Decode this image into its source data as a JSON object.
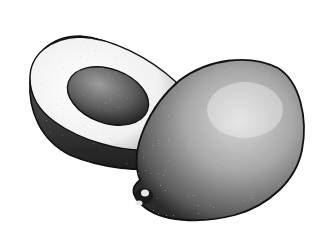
{
  "image": {
    "subject": "Stippled pen-and-ink illustration of avocados",
    "elements": [
      {
        "name": "halved-avocado",
        "description": "Avocado half showing flesh and seed, lying behind"
      },
      {
        "name": "whole-avocado",
        "description": "Whole pear-shaped avocado with stem end at lower left, in front"
      }
    ],
    "colors": {
      "background": "#ffffff",
      "ink": "#111111",
      "flesh_light": "#f4f4f4",
      "skin_mid": "#9a9a9a",
      "skin_dark": "#2a2a2a"
    }
  }
}
